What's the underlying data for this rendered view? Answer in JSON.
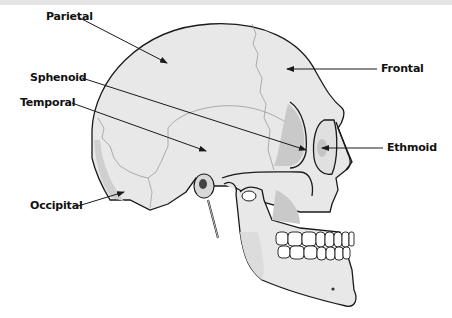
{
  "figure": {
    "labels": [
      {
        "id": "parietal",
        "text": "Parietal",
        "x": 46,
        "y": 11,
        "line": [
          78,
          17,
          167,
          63
        ]
      },
      {
        "id": "sphenoid",
        "text": "Sphenoid",
        "x": 30,
        "y": 71,
        "line": [
          82,
          78,
          306,
          150
        ]
      },
      {
        "id": "temporal",
        "text": "Temporal",
        "x": 20,
        "y": 95,
        "line": [
          72,
          103,
          206,
          151
        ]
      },
      {
        "id": "frontal",
        "text": "Frontal",
        "x": 381,
        "y": 62,
        "line": [
          377,
          69,
          287,
          69
        ]
      },
      {
        "id": "ethmoid",
        "text": "Ethmoid",
        "x": 387,
        "y": 141,
        "line": [
          383,
          148,
          322,
          148
        ]
      },
      {
        "id": "occipital",
        "text": "Occipital",
        "x": 30,
        "y": 198,
        "line": [
          78,
          206,
          124,
          192
        ]
      }
    ]
  },
  "colors": {
    "bone": "#e8e8e8",
    "bone_shadow": "#cfcfcf",
    "outline": "#1a1a1a",
    "suture": "#9a9a9a",
    "teeth": "#ffffff",
    "label": "#111111",
    "background": "#ffffff",
    "topbar": "#e4e4e4"
  }
}
